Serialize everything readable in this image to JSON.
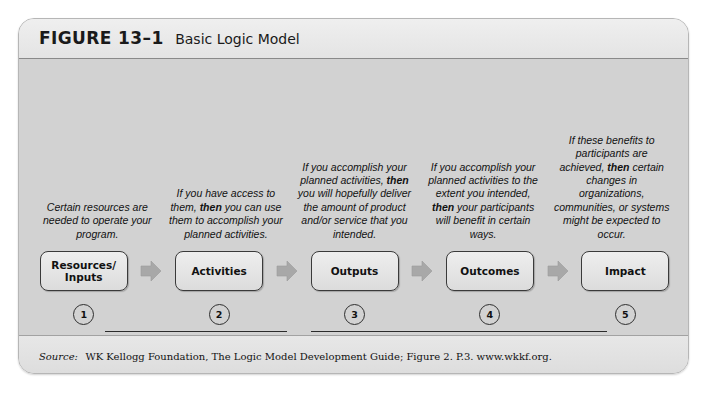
{
  "figure": {
    "label": "FIGURE 13–1",
    "title": "Basic Logic Model"
  },
  "colors": {
    "panel_background": "#d2d2d2",
    "frame_background": "#e6e6e6",
    "box_fill": "#e6e6e6",
    "box_border": "#3a3a3a",
    "arrow_fill": "#a8a8a8",
    "text": "#111111"
  },
  "stages": [
    {
      "number": "1",
      "box_label": "Resources/\nInputs",
      "box_label_line1": "Resources/",
      "box_label_line2": "Inputs",
      "description_pre": "Certain resources are needed to operate your program.",
      "description_bold": "",
      "description_post": ""
    },
    {
      "number": "2",
      "box_label": "Activities",
      "box_label_line1": "Activities",
      "box_label_line2": "",
      "description_pre": "If you have access to them, ",
      "description_bold": "then",
      "description_post": " you can use them to accomplish your planned activities."
    },
    {
      "number": "3",
      "box_label": "Outputs",
      "box_label_line1": "Outputs",
      "box_label_line2": "",
      "description_pre": "If you accomplish your planned activities, ",
      "description_bold": "then",
      "description_post": " you will hopefully deliver the amount of product and/or service that you intended."
    },
    {
      "number": "4",
      "box_label": "Outcomes",
      "box_label_line1": "Outcomes",
      "box_label_line2": "",
      "description_pre": "If you accomplish your planned activities to the extent you intended, ",
      "description_bold": "then",
      "description_post": " your participants will benefit in certain ways."
    },
    {
      "number": "5",
      "box_label": "Impact",
      "box_label_line1": "Impact",
      "box_label_line2": "",
      "description_pre": "If these benefits to participants are achieved, ",
      "description_bold": "then",
      "description_post": " certain changes in organizations, communities, or systems might be expected to occur."
    }
  ],
  "groups": {
    "left_caption": "Your Planned Work",
    "right_caption": "Your Intended Results"
  },
  "source": {
    "prefix": "Source:",
    "text": "WK Kellogg Foundation, The Logic Model Development Guide; Figure 2. P.3. www.wkkf.org."
  },
  "icons": {
    "arrow": "right-arrow-icon"
  }
}
